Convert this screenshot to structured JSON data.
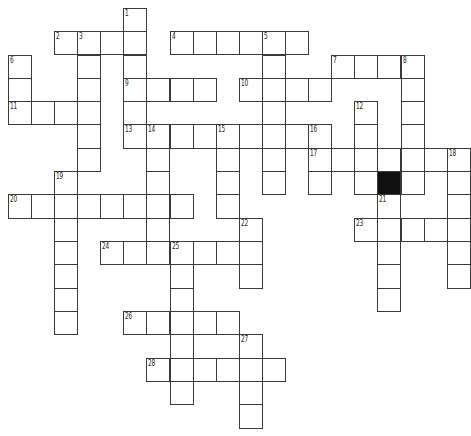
{
  "puzzle": {
    "rows": 18,
    "cols": 20,
    "origin": {
      "x": 8.3,
      "y": 8.3
    },
    "cell_w": 23.1,
    "cell_h": 23.33,
    "colors": {
      "line": "#3a3a3a",
      "fill": "#ffffff",
      "block": "#111111",
      "number": "#222222"
    },
    "black_cells": [
      [
        7,
        16
      ]
    ],
    "words": [
      {
        "num": "1",
        "dir": "down",
        "row": 0,
        "col": 5,
        "len": 6
      },
      {
        "num": "2",
        "dir": "across",
        "row": 1,
        "col": 2,
        "len": 4
      },
      {
        "num": "3",
        "dir": "down",
        "row": 1,
        "col": 3,
        "len": 6
      },
      {
        "num": "4",
        "dir": "across",
        "row": 1,
        "col": 7,
        "len": 6
      },
      {
        "num": "5",
        "dir": "down",
        "row": 1,
        "col": 11,
        "len": 7
      },
      {
        "num": "6",
        "dir": "down",
        "row": 2,
        "col": 0,
        "len": 3
      },
      {
        "num": "7",
        "dir": "across",
        "row": 2,
        "col": 14,
        "len": 4
      },
      {
        "num": "8",
        "dir": "down",
        "row": 2,
        "col": 17,
        "len": 6
      },
      {
        "num": "9",
        "dir": "across",
        "row": 3,
        "col": 5,
        "len": 4
      },
      {
        "num": "10",
        "dir": "across",
        "row": 3,
        "col": 10,
        "len": 4
      },
      {
        "num": "11",
        "dir": "across",
        "row": 4,
        "col": 0,
        "len": 4
      },
      {
        "num": "12",
        "dir": "down",
        "row": 4,
        "col": 15,
        "len": 4
      },
      {
        "num": "13",
        "dir": "across",
        "row": 5,
        "col": 5,
        "len": 9
      },
      {
        "num": "14",
        "dir": "down",
        "row": 5,
        "col": 6,
        "len": 6
      },
      {
        "num": "15",
        "dir": "down",
        "row": 5,
        "col": 9,
        "len": 4
      },
      {
        "num": "16",
        "dir": "down",
        "row": 5,
        "col": 13,
        "len": 3
      },
      {
        "num": "17",
        "dir": "across",
        "row": 6,
        "col": 13,
        "len": 7
      },
      {
        "num": "18",
        "dir": "down",
        "row": 6,
        "col": 19,
        "len": 6
      },
      {
        "num": "19",
        "dir": "down",
        "row": 7,
        "col": 2,
        "len": 7
      },
      {
        "num": "20",
        "dir": "across",
        "row": 8,
        "col": 0,
        "len": 8
      },
      {
        "num": "21",
        "dir": "down",
        "row": 8,
        "col": 16,
        "len": 5
      },
      {
        "num": "22",
        "dir": "down",
        "row": 9,
        "col": 10,
        "len": 3
      },
      {
        "num": "23",
        "dir": "across",
        "row": 9,
        "col": 15,
        "len": 5
      },
      {
        "num": "24",
        "dir": "across",
        "row": 10,
        "col": 4,
        "len": 7
      },
      {
        "num": "25",
        "dir": "down",
        "row": 10,
        "col": 7,
        "len": 7
      },
      {
        "num": "26",
        "dir": "across",
        "row": 13,
        "col": 5,
        "len": 5
      },
      {
        "num": "27",
        "dir": "down",
        "row": 14,
        "col": 10,
        "len": 4
      },
      {
        "num": "28",
        "dir": "across",
        "row": 15,
        "col": 6,
        "len": 6
      }
    ]
  }
}
